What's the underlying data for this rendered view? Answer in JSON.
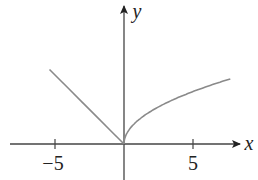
{
  "chart_data": {
    "type": "line",
    "title": "",
    "xlabel": "x",
    "ylabel": "y",
    "x_ticks": [
      -5,
      5
    ],
    "x_tick_labels": [
      "−5",
      "5"
    ],
    "xlim": [
      -8.3,
      8.4
    ],
    "ylim": [
      -2.6,
      10.2
    ],
    "grid": false,
    "legend": null,
    "series": [
      {
        "name": "left branch (y = -x)",
        "x": [
          -5.4,
          -4,
          -3,
          -2,
          -1,
          0
        ],
        "y": [
          5.4,
          4,
          3,
          2,
          1,
          0
        ]
      },
      {
        "name": "right branch (y ≈ 1.7√x)",
        "x": [
          0,
          0.25,
          0.5,
          1,
          2,
          3,
          4,
          5,
          6,
          7,
          7.7
        ],
        "y": [
          0,
          0.85,
          1.2,
          1.7,
          2.4,
          2.94,
          3.4,
          3.8,
          4.16,
          4.5,
          4.7
        ]
      }
    ],
    "colors": {
      "axes": "#333333",
      "curve": "#8a8a8a"
    }
  }
}
